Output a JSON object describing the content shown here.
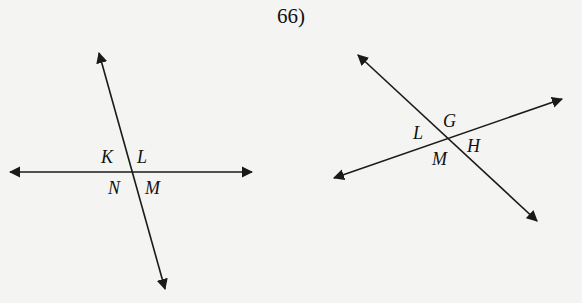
{
  "problem_number": "66)",
  "figures": [
    {
      "name": "figure-left",
      "description": "Two intersecting lines forming four angles",
      "angle_labels": {
        "top_left": "K",
        "top_right": "L",
        "bottom_left": "N",
        "bottom_right": "M"
      }
    },
    {
      "name": "figure-right",
      "description": "Two intersecting lines forming four angles",
      "angle_labels": {
        "top": "G",
        "left": "L",
        "right": "H",
        "bottom": "M"
      }
    }
  ]
}
